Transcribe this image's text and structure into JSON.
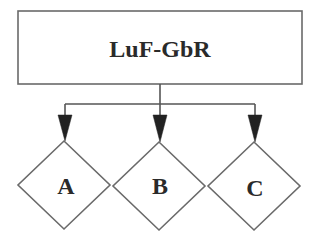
{
  "diagram": {
    "type": "hierarchy",
    "root": {
      "label": "LuF-GbR",
      "shape": "rectangle"
    },
    "children": [
      {
        "label": "A",
        "shape": "diamond"
      },
      {
        "label": "B",
        "shape": "diamond"
      },
      {
        "label": "C",
        "shape": "diamond"
      }
    ],
    "edges": [
      {
        "from": "LuF-GbR",
        "to": "A",
        "arrow": "filled"
      },
      {
        "from": "LuF-GbR",
        "to": "B",
        "arrow": "filled"
      },
      {
        "from": "LuF-GbR",
        "to": "C",
        "arrow": "filled"
      }
    ],
    "colors": {
      "stroke": "#6a6a6a",
      "text": "#2a2a2a",
      "arrow": "#222222",
      "background": "#ffffff"
    }
  }
}
